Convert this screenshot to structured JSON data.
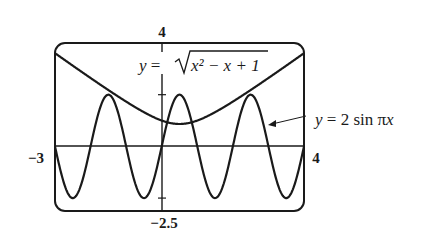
{
  "chart_data": {
    "type": "line",
    "title": "",
    "xlabel": "",
    "ylabel": "",
    "xlim": [
      -3,
      4
    ],
    "ylim": [
      -2.5,
      4
    ],
    "grid": false,
    "axis_labels": {
      "x_min": "−3",
      "x_max": "4",
      "y_min": "−2.5",
      "y_max": "4"
    },
    "y_ticks": [
      -2,
      2
    ],
    "series": [
      {
        "name": "y = √(x² − x + 1)",
        "expression": "sqrt(x^2 - x + 1)",
        "label_prefix": "y = ",
        "label_radicand": "x² − x + 1",
        "x": [
          -3,
          -2,
          -1,
          0,
          0.5,
          1,
          2,
          3,
          4
        ],
        "y": [
          3.61,
          2.65,
          1.73,
          1.0,
          0.87,
          1.0,
          1.73,
          2.65,
          3.61
        ]
      },
      {
        "name": "y = 2 sin πx",
        "expression": "2*sin(pi*x)",
        "label": "y = 2 sin πx",
        "x": [
          -3,
          -2.5,
          -2,
          -1.5,
          -1,
          -0.5,
          0,
          0.5,
          1,
          1.5,
          2,
          2.5,
          3,
          3.5,
          4
        ],
        "y": [
          0,
          -2,
          0,
          2,
          0,
          -2,
          0,
          2,
          0,
          -2,
          0,
          2,
          0,
          -2,
          0
        ]
      }
    ],
    "annotations": [
      {
        "text": "y = 2 sin πx",
        "arrow_to_series": "y = 2 sin πx"
      }
    ]
  }
}
